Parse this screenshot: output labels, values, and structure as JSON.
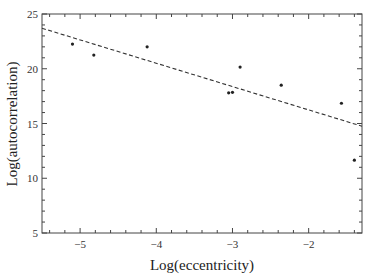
{
  "chart_data": {
    "type": "scatter",
    "title": "",
    "xlabel": "Log(eccentricity)",
    "ylabel": "Log(autocorrelation)",
    "xlim": [
      -5.5,
      -1.3
    ],
    "ylim": [
      5,
      25
    ],
    "grid": false,
    "legend": null,
    "x_ticks": [
      -5,
      -4,
      -3,
      -2
    ],
    "x_tick_labels": [
      "-5",
      "-4",
      "-3",
      "-2"
    ],
    "y_ticks": [
      5,
      10,
      15,
      20,
      25
    ],
    "y_tick_labels": [
      "5",
      "10",
      "15",
      "20",
      "25"
    ],
    "series": [
      {
        "name": "data",
        "kind": "points",
        "x": [
          -5.1,
          -4.82,
          -4.12,
          -3.05,
          -3.0,
          -2.9,
          -2.36,
          -1.57,
          -1.4
        ],
        "y": [
          22.25,
          21.25,
          22.0,
          17.8,
          17.85,
          20.15,
          18.5,
          16.85,
          11.65
        ]
      },
      {
        "name": "fit",
        "kind": "dashed-line",
        "x": [
          -5.5,
          -1.3
        ],
        "y": [
          23.7,
          14.75
        ]
      }
    ]
  }
}
